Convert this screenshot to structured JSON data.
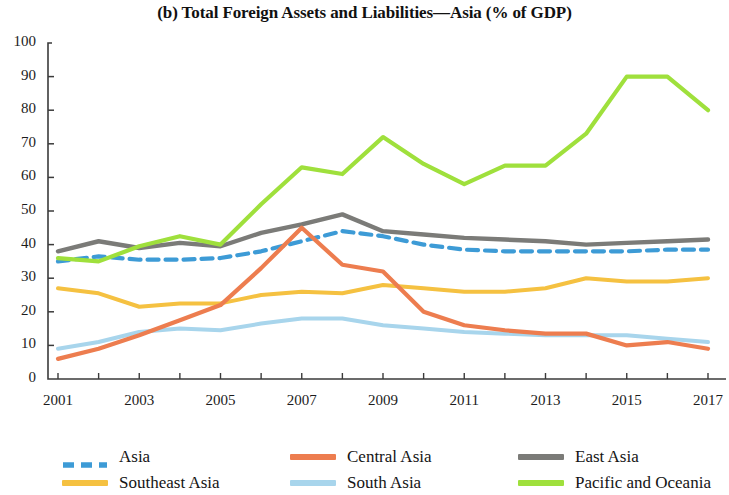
{
  "chart_data": {
    "type": "line",
    "title": "(b) Total Foreign Assets and Liabilities—Asia (% of GDP)",
    "xlabel": "",
    "ylabel": "",
    "ylim": [
      0,
      100
    ],
    "ytick_step": 10,
    "ytick_labels": [
      "100",
      "90",
      "80",
      "70",
      "60",
      "50",
      "40",
      "30",
      "20",
      "10",
      "0"
    ],
    "xlim": [
      2001,
      2017
    ],
    "x": [
      2001,
      2002,
      2003,
      2004,
      2005,
      2006,
      2007,
      2008,
      2009,
      2010,
      2011,
      2012,
      2013,
      2014,
      2015,
      2016,
      2017
    ],
    "xtick_labels": [
      "2001",
      "2003",
      "2005",
      "2007",
      "2009",
      "2011",
      "2013",
      "2015",
      "2017"
    ],
    "xticks": [
      2001,
      2003,
      2005,
      2007,
      2009,
      2011,
      2013,
      2015,
      2017
    ],
    "grid": false,
    "legend_position": "bottom",
    "series": [
      {
        "name": "Asia",
        "color": "#3d9bd6",
        "style": "dashed",
        "values": [
          35,
          36.5,
          35.5,
          35.5,
          36,
          38,
          41,
          44,
          42.5,
          40,
          38.5,
          38,
          38,
          38,
          38,
          38.5,
          38.5
        ]
      },
      {
        "name": "Central Asia",
        "color": "#ed7d4f",
        "style": "solid",
        "values": [
          6,
          9,
          13,
          17.5,
          22,
          33,
          45,
          34,
          32,
          20,
          16,
          14.5,
          13.5,
          13.5,
          10,
          11,
          9
        ]
      },
      {
        "name": "East Asia",
        "color": "#7b7b78",
        "style": "solid",
        "values": [
          38,
          41,
          39,
          40.5,
          39.5,
          43.5,
          46,
          49,
          44,
          43,
          42,
          41.5,
          41,
          40,
          40.5,
          41,
          41.5
        ]
      },
      {
        "name": "Southeast Asia",
        "color": "#f5c141",
        "style": "solid",
        "values": [
          27,
          25.5,
          21.5,
          22.5,
          22.5,
          25,
          26,
          25.5,
          28,
          27,
          26,
          26,
          27,
          30,
          29,
          29,
          30
        ]
      },
      {
        "name": "South Asia",
        "color": "#a8d5ec",
        "style": "solid",
        "values": [
          9,
          11,
          14,
          15,
          14.5,
          16.5,
          18,
          18,
          16,
          15,
          14,
          13.5,
          13,
          13,
          13,
          12,
          11
        ]
      },
      {
        "name": "Pacific and Oceania",
        "color": "#9fe03c",
        "style": "solid",
        "values": [
          36,
          35,
          39.5,
          42.5,
          40,
          52,
          63,
          61,
          72,
          64,
          58,
          63.5,
          63.5,
          73,
          90,
          90,
          80
        ]
      }
    ]
  },
  "legend": {
    "rows": [
      [
        {
          "label": "Asia",
          "color": "#3d9bd6",
          "style": "dashed"
        },
        {
          "label": "Central Asia",
          "color": "#ed7d4f",
          "style": "solid"
        },
        {
          "label": "East Asia",
          "color": "#7b7b78",
          "style": "solid"
        }
      ],
      [
        {
          "label": "Southeast Asia",
          "color": "#f5c141",
          "style": "solid"
        },
        {
          "label": "South Asia",
          "color": "#a8d5ec",
          "style": "solid"
        },
        {
          "label": "Pacific and Oceania",
          "color": "#9fe03c",
          "style": "solid"
        }
      ]
    ]
  }
}
